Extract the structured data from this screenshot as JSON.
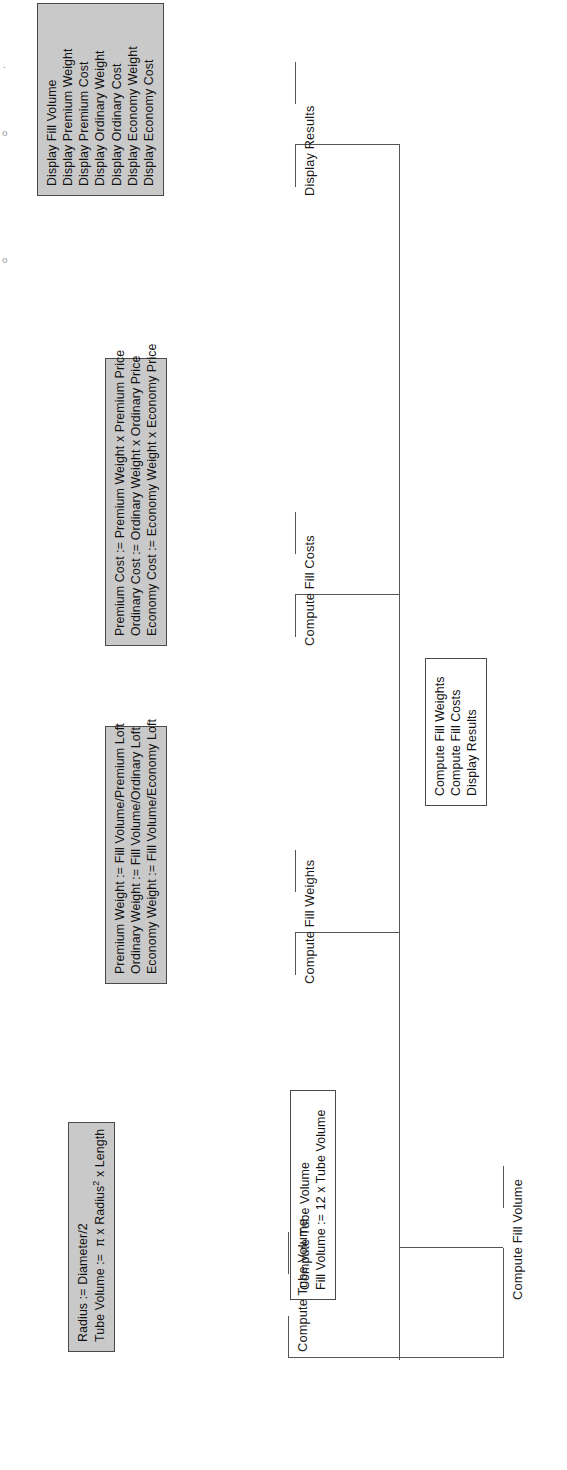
{
  "diagram": {
    "type": "structure-chart",
    "orientation": "rotated-90-ccw",
    "root": {
      "name": "root-node",
      "style": "plain",
      "lines": [
        "Compute Fill Weights",
        "Compute Fill Costs",
        "Display Results"
      ]
    },
    "branches": [
      {
        "id": "compute-fill-volume",
        "caption": "Compute Fill Volume",
        "box": {
          "style": "plain",
          "lines": [
            {
              "text": "Compute Tube Volume",
              "highlight": false
            },
            {
              "text": "Fill Volume :=  12 x Tube Volume",
              "highlight": true
            }
          ]
        },
        "child": {
          "id": "compute-tube-volume",
          "caption": "Compute Tube Volume",
          "box": {
            "style": "shaded",
            "lines": [
              {
                "text": "Radius :=  Diameter/2",
                "highlight": false
              },
              {
                "text": "Tube Volume :=  π x Radius² x Length",
                "highlight": false
              }
            ]
          }
        }
      },
      {
        "id": "compute-fill-weights",
        "caption": "Compute Fill Weights",
        "box": {
          "style": "shaded",
          "lines": [
            {
              "text": "Premium Weight  :=   Fill Volume/Premium Loft",
              "highlight": false
            },
            {
              "text": "Ordinary Weight  :=   Fill Volume/Ordinary Loft",
              "highlight": false
            },
            {
              "text": "Economy Weight  :=  Fill Volume/Economy Loft",
              "highlight": false
            }
          ]
        }
      },
      {
        "id": "compute-fill-costs",
        "caption": "Compute Fill Costs",
        "box": {
          "style": "shaded",
          "lines": [
            {
              "text": "Premium Cost  := Premium Weight x Premium Price",
              "highlight": false
            },
            {
              "text": "Ordinary Cost  :=  Ordinary Weight x Ordinary Price",
              "highlight": false
            },
            {
              "text": "Economy Cost  := Economy Weight x Economy Price",
              "highlight": false
            }
          ]
        }
      },
      {
        "id": "display-results",
        "caption": "Display Results",
        "box": {
          "style": "shaded",
          "lines": [
            {
              "text": "Display Fill Volume",
              "highlight": false
            },
            {
              "text": "Display Premium Weight",
              "highlight": false
            },
            {
              "text": "Display Premium Cost",
              "highlight": false
            },
            {
              "text": "Display Ordinary Weight",
              "highlight": false
            },
            {
              "text": "Display Ordinary Cost",
              "highlight": false
            },
            {
              "text": "Display Economy Weight",
              "highlight": false
            },
            {
              "text": "Display Economy Cost",
              "highlight": false
            }
          ]
        }
      }
    ],
    "page_marks": [
      ".",
      "o",
      "o"
    ]
  }
}
